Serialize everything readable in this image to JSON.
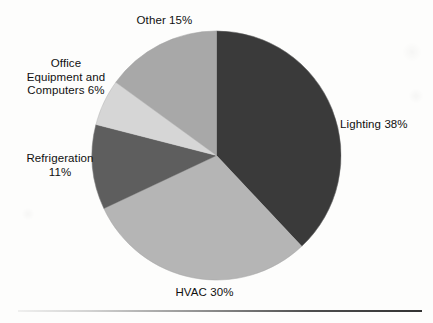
{
  "chart_data": {
    "type": "pie",
    "title": "",
    "subtitle": "",
    "xlabel": "",
    "ylabel": "",
    "legend_position": "none",
    "labels_position": "outside",
    "start_angle_deg": 0,
    "direction": "clockwise",
    "categories": [
      "Lighting",
      "HVAC",
      "Refrigeration",
      "Office Equipment and Computers",
      "Other"
    ],
    "values": [
      38,
      30,
      11,
      6,
      15
    ],
    "value_unit": "%",
    "slices": [
      {
        "name": "Lighting",
        "value": 38,
        "label": "Lighting 38%",
        "color": "#3a3a3a"
      },
      {
        "name": "HVAC",
        "value": 30,
        "label": "HVAC 30%",
        "color": "#b5b5b5"
      },
      {
        "name": "Refrigeration",
        "value": 11,
        "label": "Refrigeration\n11%",
        "color": "#5e5e5e"
      },
      {
        "name": "Office Equipment and Computers",
        "value": 6,
        "label": "Office\nEquipment and\nComputers 6%",
        "color": "#d6d6d6"
      },
      {
        "name": "Other",
        "value": 15,
        "label": "Other 15%",
        "color": "#a8a8a8"
      }
    ]
  },
  "figure": {
    "background_color": "#fdfdfc",
    "text_color": "#101010",
    "outline_color": "#9a9a9a",
    "rule_color": "#3a3a3a"
  }
}
